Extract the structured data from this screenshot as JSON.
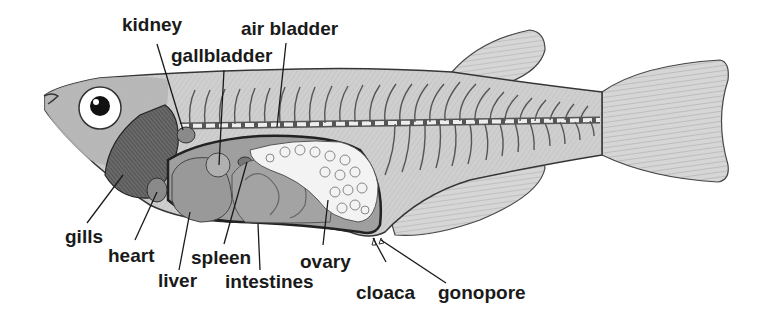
{
  "diagram": {
    "colors": {
      "body": "#c9c9c9",
      "outline": "#333333",
      "organ_dark": "#8e8e8e",
      "organ_mid": "#a5a5a5",
      "ovary": "#f2f2f2",
      "eye_white": "#ffffff",
      "pupil": "#111111",
      "label_text": "#1a1a1a"
    },
    "labels": [
      {
        "id": "kidney",
        "text": "kidney"
      },
      {
        "id": "gallbladder",
        "text": "gallbladder"
      },
      {
        "id": "air_bladder",
        "text": "air bladder"
      },
      {
        "id": "gills",
        "text": "gills"
      },
      {
        "id": "heart",
        "text": "heart"
      },
      {
        "id": "liver",
        "text": "liver"
      },
      {
        "id": "spleen",
        "text": "spleen"
      },
      {
        "id": "intestines",
        "text": "intestines"
      },
      {
        "id": "ovary",
        "text": "ovary"
      },
      {
        "id": "cloaca",
        "text": "cloaca"
      },
      {
        "id": "gonopore",
        "text": "gonopore"
      }
    ]
  }
}
